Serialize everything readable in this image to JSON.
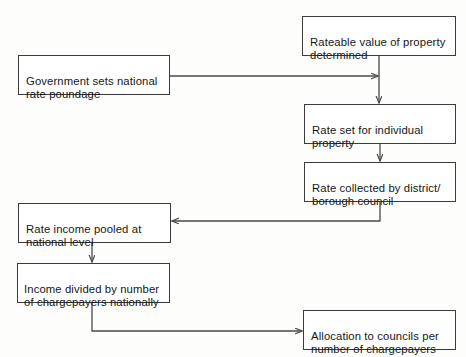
{
  "diagram": {
    "background_color": "#fdfdfc",
    "line_color": "#4a4a4a",
    "box_border_color": "#3b3b3b",
    "text_color": "#161616",
    "nodes": [
      {
        "id": "rateable-value",
        "label": "Rateable value of property determined",
        "x": 302,
        "y": 16,
        "w": 154,
        "h": 40
      },
      {
        "id": "government-poundage",
        "label": "Government sets national rate poundage",
        "x": 18,
        "y": 55,
        "w": 152,
        "h": 40
      },
      {
        "id": "rate-set-individual",
        "label": "Rate set for individual property",
        "x": 304,
        "y": 104,
        "w": 152,
        "h": 40
      },
      {
        "id": "rate-collected",
        "label": "Rate collected by district/ borough council",
        "x": 304,
        "y": 162,
        "w": 152,
        "h": 40
      },
      {
        "id": "rate-income-pooled",
        "label": "Rate income pooled at national level",
        "x": 18,
        "y": 203,
        "w": 153,
        "h": 40
      },
      {
        "id": "income-divided",
        "label": "Income divided by number of chargepayers nationally",
        "x": 17,
        "y": 263,
        "w": 153,
        "h": 40
      },
      {
        "id": "allocation-councils",
        "label": "Allocation to councils per number of chargepayers",
        "x": 303,
        "y": 310,
        "w": 153,
        "h": 40
      }
    ],
    "connectors": [
      {
        "id": "rateable-to-junction",
        "from": "rateable-value",
        "to": "rate-set-individual",
        "kind": "vertical-arrow"
      },
      {
        "id": "government-to-junction",
        "from": "government-poundage",
        "to": "rate-set-individual",
        "kind": "horizontal-arrow"
      },
      {
        "id": "set-to-collected",
        "from": "rate-set-individual",
        "to": "rate-collected",
        "kind": "vertical-arrow"
      },
      {
        "id": "collected-to-pooled",
        "from": "rate-collected",
        "to": "rate-income-pooled",
        "kind": "elbow-left-arrow"
      },
      {
        "id": "pooled-to-divided",
        "from": "rate-income-pooled",
        "to": "income-divided",
        "kind": "vertical-arrow"
      },
      {
        "id": "divided-to-allocation",
        "from": "income-divided",
        "to": "allocation-councils",
        "kind": "elbow-right-arrow"
      }
    ]
  }
}
